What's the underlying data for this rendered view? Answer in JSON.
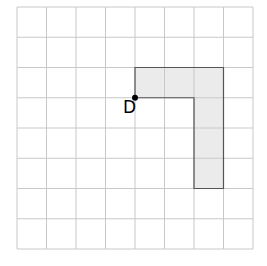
{
  "grid": {
    "cols": 8,
    "rows": 8,
    "origin_x": 17,
    "origin_y": 7,
    "cell_w": 29.5,
    "cell_h": 30.25,
    "line_color": "#c8c8c8"
  },
  "shape": {
    "fill": "#ebebeb",
    "stroke": "#555555",
    "cells": [
      [
        4,
        2
      ],
      [
        5,
        2
      ],
      [
        6,
        2
      ],
      [
        6,
        3
      ],
      [
        6,
        4
      ],
      [
        6,
        5
      ]
    ],
    "outline": [
      [
        4,
        2
      ],
      [
        7,
        2
      ],
      [
        7,
        6
      ],
      [
        6,
        6
      ],
      [
        6,
        3
      ],
      [
        4,
        3
      ]
    ]
  },
  "point": {
    "label": "D",
    "grid_x": 4,
    "grid_y": 3,
    "color": "#000000"
  }
}
